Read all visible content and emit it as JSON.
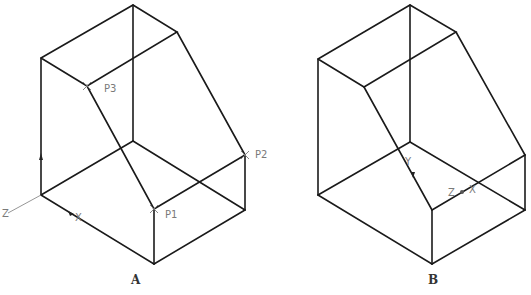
{
  "figures": [
    {
      "id": "A",
      "caption": "A",
      "points": [
        {
          "label": "P1"
        },
        {
          "label": "P2"
        },
        {
          "label": "P3"
        }
      ],
      "ucs": {
        "x": "X",
        "y": "Y",
        "z": "Z"
      }
    },
    {
      "id": "B",
      "caption": "B",
      "points": [],
      "ucs": {
        "x": "X",
        "y": "Y",
        "z": "Z"
      }
    }
  ],
  "colors": {
    "edge": "#1a1a1a",
    "annotation": "#7a7a7a"
  }
}
